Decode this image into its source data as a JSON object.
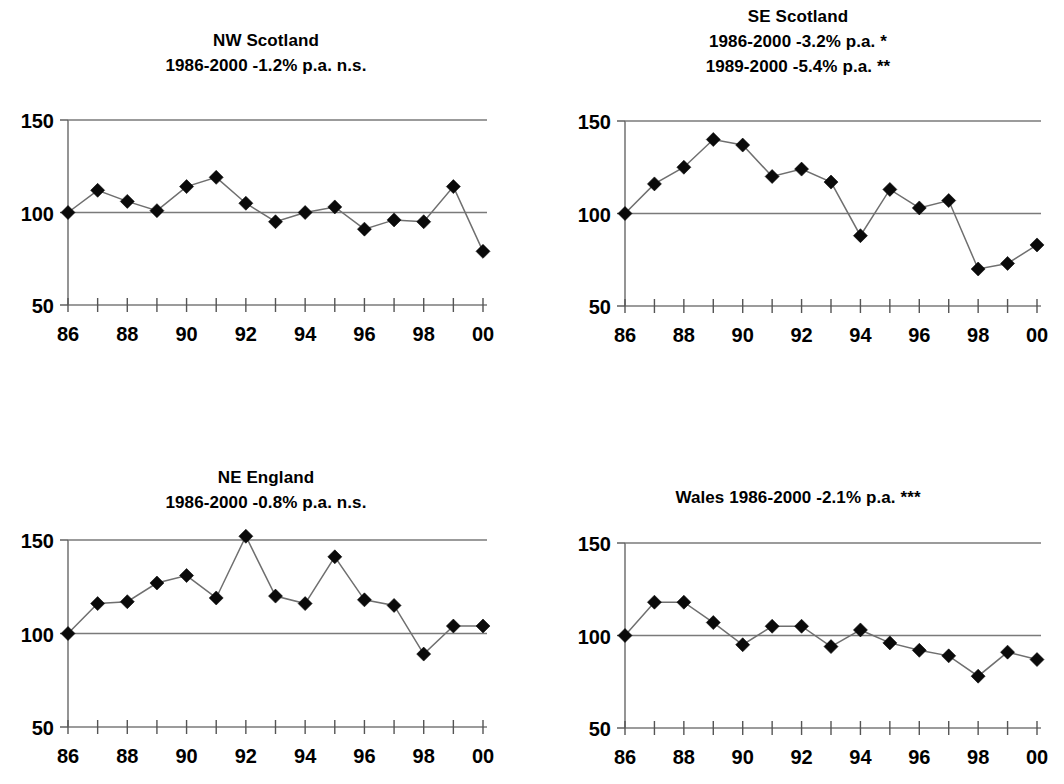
{
  "figure": {
    "background": "#ffffff",
    "marker_color": "#111111",
    "line_color": "#6f6f6f",
    "axis_color": "#7a7a7a"
  },
  "chart_data": [
    {
      "type": "line",
      "panel": "top-left",
      "title": "NW Scotland",
      "subtitle_lines": [
        "1986-2000 -1.2% p.a. n.s."
      ],
      "xlabel": "",
      "ylabel": "",
      "x": [
        86,
        87,
        88,
        89,
        90,
        91,
        92,
        93,
        94,
        95,
        96,
        97,
        98,
        99,
        100
      ],
      "categories": [
        "86",
        "87",
        "88",
        "89",
        "90",
        "91",
        "92",
        "93",
        "94",
        "95",
        "96",
        "97",
        "98",
        "99",
        "00"
      ],
      "tick_labels": [
        "86",
        "",
        "88",
        "",
        "90",
        "",
        "92",
        "",
        "94",
        "",
        "96",
        "",
        "98",
        "",
        "00"
      ],
      "values": [
        100,
        112,
        106,
        101,
        114,
        119,
        105,
        95,
        100,
        103,
        91,
        96,
        95,
        114,
        79
      ],
      "ylim": [
        50,
        150
      ],
      "yticks": [
        50,
        100,
        150
      ],
      "ytick_labels": [
        "50",
        "100",
        "150"
      ],
      "reference_lines": [
        100,
        150
      ],
      "grid": false,
      "legend": "none"
    },
    {
      "type": "line",
      "panel": "top-right",
      "title": "SE Scotland",
      "subtitle_lines": [
        "1986-2000 -3.2% p.a. *",
        "1989-2000 -5.4% p.a. **"
      ],
      "xlabel": "",
      "ylabel": "",
      "x": [
        86,
        87,
        88,
        89,
        90,
        91,
        92,
        93,
        94,
        95,
        96,
        97,
        98,
        99,
        100
      ],
      "categories": [
        "86",
        "87",
        "88",
        "89",
        "90",
        "91",
        "92",
        "93",
        "94",
        "95",
        "96",
        "97",
        "98",
        "99",
        "00"
      ],
      "tick_labels": [
        "86",
        "",
        "88",
        "",
        "90",
        "",
        "92",
        "",
        "94",
        "",
        "96",
        "",
        "98",
        "",
        "00"
      ],
      "values": [
        100,
        116,
        125,
        140,
        137,
        120,
        124,
        117,
        88,
        113,
        103,
        107,
        70,
        73,
        83
      ],
      "ylim": [
        50,
        150
      ],
      "yticks": [
        50,
        100,
        150
      ],
      "ytick_labels": [
        "50",
        "100",
        "150"
      ],
      "reference_lines": [
        100,
        150
      ],
      "grid": false,
      "legend": "none"
    },
    {
      "type": "line",
      "panel": "bottom-left",
      "title": "NE England",
      "subtitle_lines": [
        "1986-2000 -0.8% p.a. n.s."
      ],
      "xlabel": "",
      "ylabel": "",
      "x": [
        86,
        87,
        88,
        89,
        90,
        91,
        92,
        93,
        94,
        95,
        96,
        97,
        98,
        99,
        100
      ],
      "categories": [
        "86",
        "87",
        "88",
        "89",
        "90",
        "91",
        "92",
        "93",
        "94",
        "95",
        "96",
        "97",
        "98",
        "99",
        "00"
      ],
      "tick_labels": [
        "86",
        "",
        "88",
        "",
        "90",
        "",
        "92",
        "",
        "94",
        "",
        "96",
        "",
        "98",
        "",
        "00"
      ],
      "values": [
        100,
        116,
        117,
        127,
        131,
        119,
        152,
        120,
        116,
        141,
        118,
        115,
        89,
        104,
        104
      ],
      "ylim": [
        50,
        150
      ],
      "yticks": [
        50,
        100,
        150
      ],
      "ytick_labels": [
        "50",
        "100",
        "150"
      ],
      "reference_lines": [
        100,
        150
      ],
      "grid": false,
      "legend": "none"
    },
    {
      "type": "line",
      "panel": "bottom-right",
      "title": "Wales 1986-2000 -2.1% p.a. ***",
      "subtitle_lines": [],
      "xlabel": "",
      "ylabel": "",
      "x": [
        86,
        87,
        88,
        89,
        90,
        91,
        92,
        93,
        94,
        95,
        96,
        97,
        98,
        99,
        100
      ],
      "categories": [
        "86",
        "87",
        "88",
        "89",
        "90",
        "91",
        "92",
        "93",
        "94",
        "95",
        "96",
        "97",
        "98",
        "99",
        "00"
      ],
      "tick_labels": [
        "86",
        "",
        "88",
        "",
        "90",
        "",
        "92",
        "",
        "94",
        "",
        "96",
        "",
        "98",
        "",
        "00"
      ],
      "values": [
        100,
        118,
        118,
        107,
        95,
        105,
        105,
        94,
        103,
        96,
        92,
        89,
        78,
        91,
        87
      ],
      "ylim": [
        50,
        150
      ],
      "yticks": [
        50,
        100,
        150
      ],
      "ytick_labels": [
        "50",
        "100",
        "150"
      ],
      "reference_lines": [
        100,
        150
      ],
      "grid": false,
      "legend": "none"
    }
  ]
}
